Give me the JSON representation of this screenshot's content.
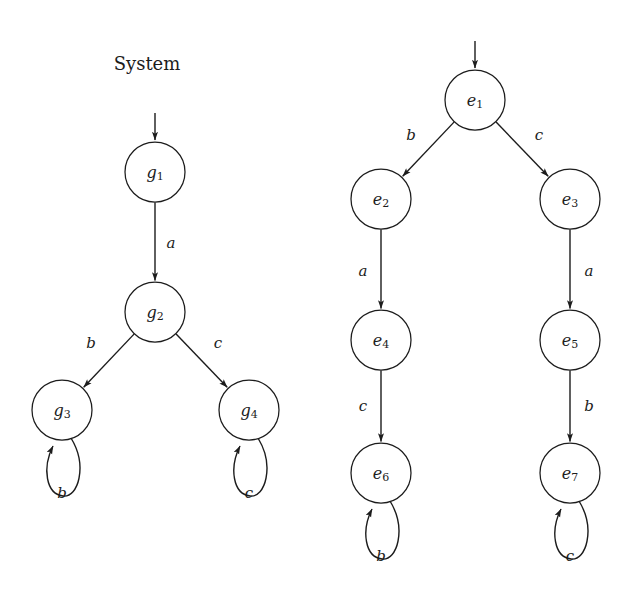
{
  "figure": {
    "background_color": "#ffffff",
    "stroke_color": "#1c1c1c",
    "title": "System"
  },
  "chart_data": {
    "type": "diagram",
    "subtype": "state-transition-automaton",
    "title": "System",
    "panels": [
      {
        "id": "left-automaton",
        "name": "System",
        "label": "System",
        "label_x": 147,
        "label_y": 70,
        "initial_state": "g1",
        "nodes": [
          {
            "id": "g1",
            "base": "g",
            "sub": "1",
            "cx": 155,
            "cy": 172,
            "r": 30
          },
          {
            "id": "g2",
            "base": "g",
            "sub": "2",
            "cx": 155,
            "cy": 312,
            "r": 30
          },
          {
            "id": "g3",
            "base": "g",
            "sub": "3",
            "cx": 62,
            "cy": 410,
            "r": 30
          },
          {
            "id": "g4",
            "base": "g",
            "sub": "4",
            "cx": 249,
            "cy": 410,
            "r": 30
          }
        ],
        "entry_arrow": {
          "x1": 155,
          "y1": 113,
          "x2": 155,
          "y2": 140
        },
        "edges": [
          {
            "from": "g1",
            "to": "g2",
            "label": "a",
            "label_x": 171,
            "label_y": 248
          },
          {
            "from": "g2",
            "to": "g3",
            "label": "b",
            "label_x": 91,
            "label_y": 348
          },
          {
            "from": "g2",
            "to": "g4",
            "label": "c",
            "label_x": 218,
            "label_y": 348
          }
        ],
        "self_loops": [
          {
            "on": "g3",
            "label": "b",
            "label_x": 62,
            "label_y": 498
          },
          {
            "on": "g4",
            "label": "c",
            "label_x": 249,
            "label_y": 498
          }
        ]
      },
      {
        "id": "right-automaton",
        "name": "",
        "label": "",
        "initial_state": "e1",
        "nodes": [
          {
            "id": "e1",
            "base": "e",
            "sub": "1",
            "cx": 475,
            "cy": 100,
            "r": 30
          },
          {
            "id": "e2",
            "base": "e",
            "sub": "2",
            "cx": 381,
            "cy": 199,
            "r": 30
          },
          {
            "id": "e3",
            "base": "e",
            "sub": "3",
            "cx": 570,
            "cy": 199,
            "r": 30
          },
          {
            "id": "e4",
            "base": "e",
            "sub": "4",
            "cx": 381,
            "cy": 340,
            "r": 30
          },
          {
            "id": "e5",
            "base": "e",
            "sub": "5",
            "cx": 570,
            "cy": 340,
            "r": 30
          },
          {
            "id": "e6",
            "base": "e",
            "sub": "6",
            "cx": 381,
            "cy": 473,
            "r": 30
          },
          {
            "id": "e7",
            "base": "e",
            "sub": "7",
            "cx": 570,
            "cy": 473,
            "r": 30
          }
        ],
        "entry_arrow": {
          "x1": 475,
          "y1": 41,
          "x2": 475,
          "y2": 68
        },
        "edges": [
          {
            "from": "e1",
            "to": "e2",
            "label": "b",
            "label_x": 411,
            "label_y": 140
          },
          {
            "from": "e1",
            "to": "e3",
            "label": "c",
            "label_x": 539,
            "label_y": 140
          },
          {
            "from": "e2",
            "to": "e4",
            "label": "a",
            "label_x": 363,
            "label_y": 276
          },
          {
            "from": "e3",
            "to": "e5",
            "label": "a",
            "label_x": 589,
            "label_y": 276
          },
          {
            "from": "e4",
            "to": "e6",
            "label": "c",
            "label_x": 363,
            "label_y": 411
          },
          {
            "from": "e5",
            "to": "e7",
            "label": "b",
            "label_x": 589,
            "label_y": 411
          }
        ],
        "self_loops": [
          {
            "on": "e6",
            "label": "b",
            "label_x": 381,
            "label_y": 561
          },
          {
            "on": "e7",
            "label": "c",
            "label_x": 570,
            "label_y": 561
          }
        ]
      }
    ],
    "alphabet": [
      "a",
      "b",
      "c"
    ],
    "legend": [],
    "grid": false
  }
}
